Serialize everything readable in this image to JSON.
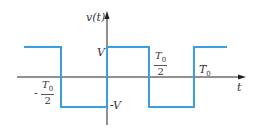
{
  "diagram": {
    "y_axis_label": "v(t)",
    "x_axis_label": "t",
    "level_high_label": "V",
    "level_low_label": "-V",
    "tick_neg_half": {
      "sign": "-",
      "num": "T",
      "num_sub": "0",
      "den": "2"
    },
    "tick_pos_half": {
      "num": "T",
      "num_sub": "0",
      "den": "2"
    },
    "tick_period": {
      "main": "T",
      "sub": "0"
    },
    "colors": {
      "waveform": "#3a9ee0",
      "axes": "#222222",
      "text": "#333333"
    }
  }
}
